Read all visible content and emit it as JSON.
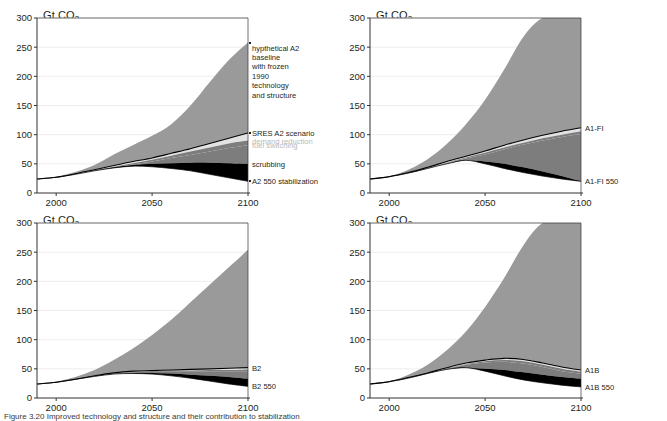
{
  "figure": {
    "caption": "Figure 3.20  Improved technology and structure and their contribution to stabilization",
    "axis": {
      "y_label_text": "Gt CO",
      "y_label_sub": "2",
      "y_ticks": [
        0,
        50,
        100,
        150,
        200,
        250,
        300
      ],
      "x_ticks": [
        2000,
        2050,
        2100
      ],
      "xlim": [
        1990,
        2100
      ],
      "ylim": [
        0,
        300
      ]
    },
    "colors": {
      "baseline_gray": "#9a9a9a",
      "demand_reduction_light": "#e2e2e2",
      "fuel_switching_gray": "#7d7d7d",
      "scrubbing_black": "#000000",
      "scenario_line": "#000000",
      "grid": "#e8e8e8",
      "axis": "#333333",
      "faint_label": "#b9b9b9"
    }
  },
  "chart_data": {
    "type": "area",
    "xlabel": "",
    "ylabel": "Gt CO2",
    "xlim": [
      1990,
      2100
    ],
    "ylim": [
      0,
      300
    ],
    "grid": true,
    "legend_position": "right-inline-annotations",
    "panels": [
      {
        "id": "a2",
        "position": "top-left",
        "x": [
          1990,
          2000,
          2010,
          2020,
          2030,
          2040,
          2050,
          2060,
          2070,
          2080,
          2090,
          2100
        ],
        "series": [
          {
            "name": "hypthetical A2 baseline with frozen 1990 technology and structure",
            "values": [
              24,
              28,
              36,
              48,
              66,
              82,
              98,
              118,
              150,
              190,
              228,
              258
            ]
          },
          {
            "name": "SRES A2 scenario",
            "values": [
              24,
              27,
              33,
              40,
              47,
              54,
              60,
              68,
              76,
              85,
              94,
              103
            ]
          },
          {
            "name": "demand reduction (upper edge)",
            "values": [
              24,
              27,
              32,
              39,
              45,
              51,
              57,
              64,
              71,
              78,
              85,
              90
            ]
          },
          {
            "name": "fuel switching (upper edge)",
            "values": [
              24,
              27,
              32,
              38,
              44,
              49,
              54,
              60,
              65,
              71,
              77,
              82
            ]
          },
          {
            "name": "scrubbing (upper edge)",
            "values": [
              24,
              27,
              32,
              38,
              44,
              48,
              50,
              51,
              52,
              52,
              51,
              50
            ]
          },
          {
            "name": "A2 550 stabilization",
            "values": [
              24,
              27,
              32,
              38,
              43,
              46,
              45,
              42,
              38,
              32,
              26,
              20
            ]
          }
        ],
        "annotations": [
          {
            "text": "hypthetical A2\nbaseline\nwith frozen\n1990\ntechnology\nand structure",
            "value": 258
          },
          {
            "text": "SRES A2 scenario",
            "value": 103
          },
          {
            "text": "demand reduction",
            "value": 90,
            "faint": true
          },
          {
            "text": "fuel switching",
            "value": 82,
            "faint": true
          },
          {
            "text": "scrubbing",
            "value": 50
          },
          {
            "text": "A2 550 stabilization",
            "value": 20
          }
        ]
      },
      {
        "id": "a1fi",
        "position": "top-right",
        "x": [
          1990,
          2000,
          2010,
          2020,
          2030,
          2040,
          2050,
          2060,
          2070,
          2080,
          2090,
          2100
        ],
        "series": [
          {
            "name": "hypthetical A1-FI baseline",
            "values": [
              24,
              29,
              40,
              58,
              84,
              118,
              160,
              212,
              268,
              300,
              300,
              300
            ]
          },
          {
            "name": "A1-FI",
            "values": [
              24,
              28,
              35,
              44,
              54,
              63,
              72,
              82,
              91,
              99,
              106,
              112
            ]
          },
          {
            "name": "demand reduction (upper edge)",
            "values": [
              24,
              28,
              34,
              43,
              52,
              61,
              69,
              78,
              86,
              94,
              100,
              106
            ]
          },
          {
            "name": "fuel switching (upper edge)",
            "values": [
              24,
              28,
              34,
              42,
              51,
              59,
              66,
              75,
              83,
              90,
              96,
              101
            ]
          },
          {
            "name": "scrubbing (upper edge)",
            "values": [
              24,
              28,
              34,
              42,
              50,
              56,
              54,
              50,
              44,
              37,
              29,
              20
            ]
          },
          {
            "name": "A1-FI 550",
            "values": [
              24,
              28,
              34,
              42,
              50,
              56,
              50,
              42,
              35,
              29,
              24,
              20
            ]
          }
        ],
        "annotations": [
          {
            "text": "A1-FI",
            "value": 112
          },
          {
            "text": "A1-FI 550",
            "value": 20
          }
        ]
      },
      {
        "id": "b2",
        "position": "bottom-left",
        "x": [
          1990,
          2000,
          2010,
          2020,
          2030,
          2040,
          2050,
          2060,
          2070,
          2080,
          2090,
          2100
        ],
        "series": [
          {
            "name": "hypthetical B2 baseline",
            "values": [
              24,
              28,
              36,
              48,
              65,
              85,
              108,
              134,
              164,
              194,
              224,
              254
            ]
          },
          {
            "name": "B2",
            "values": [
              24,
              27,
              32,
              38,
              43,
              46,
              47,
              48,
              49,
              50,
              51,
              52
            ]
          },
          {
            "name": "demand reduction (upper edge)",
            "values": [
              24,
              27,
              32,
              37,
              42,
              45,
              46,
              47,
              47,
              48,
              48,
              49
            ]
          },
          {
            "name": "fuel switching (upper edge)",
            "values": [
              24,
              27,
              32,
              37,
              42,
              44,
              45,
              45,
              45,
              45,
              45,
              45
            ]
          },
          {
            "name": "scrubbing (upper edge)",
            "values": [
              24,
              27,
              32,
              37,
              41,
              43,
              43,
              42,
              40,
              38,
              36,
              33
            ]
          },
          {
            "name": "B2 550",
            "values": [
              24,
              27,
              32,
              37,
              41,
              42,
              41,
              38,
              34,
              29,
              24,
              20
            ]
          }
        ],
        "annotations": [
          {
            "text": "B2",
            "value": 52
          },
          {
            "text": "B2 550",
            "value": 20
          }
        ]
      },
      {
        "id": "a1b",
        "position": "bottom-right",
        "x": [
          1990,
          2000,
          2010,
          2020,
          2030,
          2040,
          2050,
          2060,
          2070,
          2080,
          2090,
          2100
        ],
        "series": [
          {
            "name": "hypthetical A1B baseline",
            "values": [
              24,
              29,
              40,
              57,
              82,
              114,
              156,
              206,
              262,
              300,
              300,
              300
            ]
          },
          {
            "name": "A1B",
            "values": [
              24,
              28,
              35,
              43,
              52,
              60,
              65,
              68,
              66,
              60,
              53,
              48
            ]
          },
          {
            "name": "demand reduction (upper edge)",
            "values": [
              24,
              28,
              34,
              42,
              51,
              58,
              63,
              65,
              63,
              57,
              50,
              45
            ]
          },
          {
            "name": "fuel switching (upper edge)",
            "values": [
              24,
              28,
              34,
              42,
              50,
              57,
              61,
              62,
              59,
              53,
              46,
              42
            ]
          },
          {
            "name": "scrubbing (upper edge)",
            "values": [
              24,
              28,
              34,
              42,
              49,
              52,
              50,
              48,
              44,
              40,
              36,
              33
            ]
          },
          {
            "name": "A1B 550",
            "values": [
              24,
              28,
              34,
              42,
              49,
              52,
              46,
              38,
              31,
              26,
              22,
              19
            ]
          }
        ],
        "annotations": [
          {
            "text": "A1B",
            "value": 48
          },
          {
            "text": "A1B 550",
            "value": 19
          }
        ]
      }
    ]
  }
}
